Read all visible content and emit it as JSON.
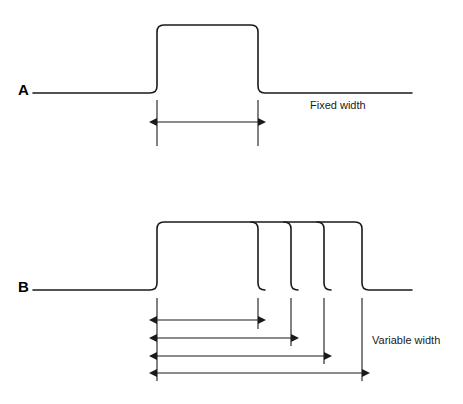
{
  "figure": {
    "type": "waveform-timing-diagram",
    "background_color": "#ffffff",
    "stroke_color": "#1a1a1a",
    "width": 463,
    "height": 404
  },
  "waveforms": [
    {
      "id": "A",
      "label": "A",
      "label_x": 18,
      "label_y": 95,
      "description": "Fixed width pulse",
      "baseline_y": 93,
      "top_y": 25,
      "baseline_start_x": 33,
      "baseline_end_x": 412,
      "rise_x": 157,
      "fall_edges_x": [
        258
      ],
      "annotation": {
        "text": "Fixed width",
        "x": 310,
        "y": 109
      },
      "ticks": [
        {
          "x": 157,
          "y1": 100,
          "y2": 146
        },
        {
          "x": 258,
          "y1": 100,
          "y2": 146
        }
      ],
      "dimensions": [
        {
          "y": 122,
          "x1": 157,
          "x2": 258
        }
      ]
    },
    {
      "id": "B",
      "label": "B",
      "label_x": 18,
      "label_y": 292,
      "description": "Variable width pulses",
      "baseline_y": 290,
      "top_y": 222,
      "baseline_start_x": 33,
      "baseline_end_x": 412,
      "rise_x": 157,
      "fall_edges_x": [
        258,
        291,
        324,
        362
      ],
      "annotation": {
        "text": "Variable width",
        "x": 372,
        "y": 344
      },
      "ticks": [
        {
          "x": 157,
          "y1": 298,
          "y2": 381
        },
        {
          "x": 258,
          "y1": 298,
          "y2": 329
        },
        {
          "x": 291,
          "y1": 298,
          "y2": 346
        },
        {
          "x": 324,
          "y1": 298,
          "y2": 364
        },
        {
          "x": 362,
          "y1": 298,
          "y2": 381
        }
      ],
      "dimensions": [
        {
          "y": 320,
          "x1": 157,
          "x2": 258
        },
        {
          "y": 338,
          "x1": 157,
          "x2": 291
        },
        {
          "y": 356,
          "x1": 157,
          "x2": 324
        },
        {
          "y": 373,
          "x1": 157,
          "x2": 362
        }
      ]
    }
  ]
}
